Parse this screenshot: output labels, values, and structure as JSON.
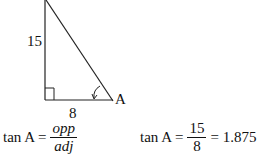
{
  "diagram": {
    "side_opposite": "15",
    "side_adjacent": "8",
    "angle_label": "A"
  },
  "formula_left": {
    "lhs": "tan A =",
    "numerator": "opp",
    "denominator": "adj"
  },
  "formula_right": {
    "lhs": "tan A =",
    "numerator": "15",
    "denominator": "8",
    "result": "= 1.875"
  }
}
